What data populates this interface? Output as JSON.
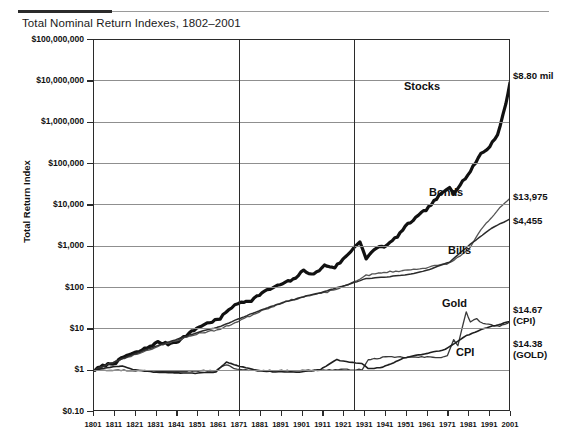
{
  "chart_title": "Total Nominal Return Indexes, 1802–2001",
  "axes": {
    "y_title": "Total Return Index",
    "y_ticks": [
      "$100,000,000",
      "$10,000,000",
      "$1,000,000",
      "$100,000",
      "$10,000",
      "$1,000",
      "$100",
      "$10",
      "$1",
      "$0.10"
    ],
    "x_ticks": [
      "1801",
      "1811",
      "1821",
      "1831",
      "1841",
      "1851",
      "1861",
      "1871",
      "1881",
      "1891",
      "1901",
      "1911",
      "1921",
      "1931",
      "1941",
      "1951",
      "1961",
      "1971",
      "1981",
      "1991",
      "2001"
    ]
  },
  "series_labels": {
    "stocks": "Stocks",
    "bonds": "Bonds",
    "bills": "Bills",
    "gold": "Gold",
    "cpi": "CPI"
  },
  "end_values": {
    "stocks": "$8.80 mil",
    "bonds": "$13,975",
    "bills": "$4,455",
    "cpi_value": "$14.67",
    "cpi_caption": "(CPI)",
    "gold_value": "$14.38",
    "gold_caption": "(GOLD)"
  },
  "chart_data": {
    "type": "line",
    "title": "Total Nominal Return Indexes, 1802–2001",
    "xlabel": "",
    "ylabel": "Total Return Index",
    "yscale": "log",
    "ylim": [
      0.1,
      100000000
    ],
    "xlim": [
      1801,
      2001
    ],
    "grid": "horizontal-and-two-vertical",
    "legend": "inline-annotations",
    "vertical_reference_years": [
      1871,
      1926
    ],
    "series": [
      {
        "name": "Stocks",
        "end_value": 8800000,
        "end_label": "$8.80 mil",
        "color": "#111111",
        "width": 3.2,
        "x": [
          1802,
          1807,
          1812,
          1817,
          1822,
          1827,
          1832,
          1837,
          1842,
          1847,
          1852,
          1857,
          1862,
          1866,
          1872,
          1877,
          1882,
          1887,
          1892,
          1897,
          1902,
          1907,
          1912,
          1917,
          1922,
          1926,
          1929,
          1932,
          1937,
          1942,
          1947,
          1952,
          1957,
          1962,
          1967,
          1972,
          1974,
          1977,
          1982,
          1987,
          1990,
          1995,
          1999,
          2001
        ],
        "y": [
          1,
          1.3,
          1.5,
          2.2,
          2.6,
          3.4,
          4.6,
          4.2,
          5.0,
          7.5,
          11,
          14,
          17,
          29,
          43,
          48,
          72,
          95,
          120,
          150,
          250,
          200,
          330,
          300,
          520,
          880,
          1300,
          480,
          900,
          1000,
          1700,
          3300,
          5200,
          8500,
          16000,
          26000,
          19000,
          30000,
          62000,
          170000,
          210000,
          480000,
          2600000,
          8800000
        ]
      },
      {
        "name": "Bonds",
        "end_value": 13975,
        "end_label": "$13,975",
        "color": "#555555",
        "width": 1.3,
        "x": [
          1802,
          1812,
          1822,
          1832,
          1842,
          1852,
          1862,
          1872,
          1882,
          1892,
          1902,
          1912,
          1922,
          1932,
          1942,
          1952,
          1962,
          1972,
          1977,
          1982,
          1987,
          1992,
          1996,
          2001
        ],
        "y": [
          1,
          1.6,
          2.4,
          3.6,
          5.3,
          7.6,
          9.5,
          16,
          27,
          42,
          58,
          72,
          105,
          190,
          230,
          255,
          300,
          380,
          560,
          900,
          2400,
          4700,
          8000,
          13975
        ]
      },
      {
        "name": "Bills",
        "end_value": 4455,
        "end_label": "$4,455",
        "color": "#2b2b2b",
        "width": 1.5,
        "x": [
          1802,
          1812,
          1822,
          1832,
          1842,
          1852,
          1862,
          1872,
          1882,
          1892,
          1902,
          1912,
          1922,
          1932,
          1942,
          1952,
          1962,
          1972,
          1982,
          1992,
          2001
        ],
        "y": [
          1,
          1.6,
          2.5,
          3.8,
          5.6,
          8.2,
          11,
          18,
          28,
          42,
          58,
          78,
          110,
          160,
          175,
          200,
          260,
          400,
          1100,
          2600,
          4455
        ]
      },
      {
        "name": "Gold",
        "end_value": 14.38,
        "end_label": "$14.38",
        "end_caption": "(GOLD)",
        "color": "#3a3a3a",
        "width": 1.3,
        "x": [
          1802,
          1820,
          1840,
          1860,
          1865,
          1870,
          1880,
          1900,
          1920,
          1930,
          1933,
          1940,
          1950,
          1960,
          1968,
          1971,
          1974,
          1976,
          1980,
          1982,
          1985,
          1988,
          1992,
          1996,
          2001
        ],
        "y": [
          1,
          0.95,
          0.92,
          0.95,
          1.35,
          1.0,
          0.95,
          0.95,
          1.0,
          1.0,
          1.7,
          2.0,
          2.0,
          2.0,
          2.0,
          2.2,
          5.2,
          3.9,
          25,
          14,
          17,
          13,
          12,
          11,
          14.38
        ]
      },
      {
        "name": "CPI",
        "end_value": 14.67,
        "end_label": "$14.67",
        "end_caption": "(CPI)",
        "color": "#1f1f1f",
        "width": 1.6,
        "x": [
          1802,
          1815,
          1820,
          1830,
          1840,
          1850,
          1860,
          1865,
          1870,
          1880,
          1890,
          1900,
          1910,
          1918,
          1921,
          1930,
          1933,
          1940,
          1945,
          1950,
          1960,
          1970,
          1980,
          1990,
          2001
        ],
        "y": [
          1,
          1.25,
          1.0,
          0.88,
          0.85,
          0.82,
          0.88,
          1.55,
          1.25,
          0.95,
          0.88,
          0.88,
          1.0,
          1.75,
          1.6,
          1.4,
          1.05,
          1.15,
          1.45,
          1.95,
          2.4,
          3.1,
          6.6,
          10.5,
          14.67
        ]
      }
    ]
  }
}
